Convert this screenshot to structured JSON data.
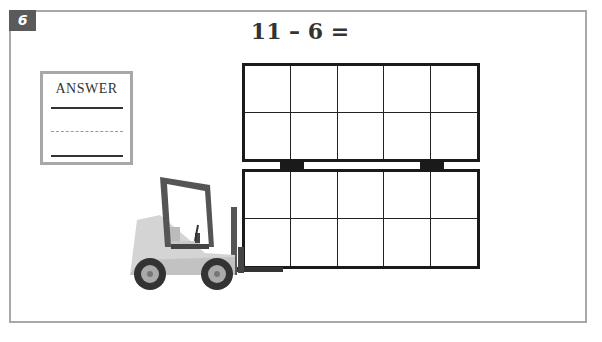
{
  "problem": {
    "number": "6",
    "equation": "11 – 6 =",
    "answer_label": "ANSWER"
  },
  "ten_frames": [
    {
      "id": "top",
      "rows": 2,
      "cols": 5,
      "filled": 0
    },
    {
      "id": "bottom",
      "rows": 2,
      "cols": 5,
      "filled": 0
    }
  ],
  "illustration": {
    "type": "forklift-icon",
    "colors": {
      "body": "#d0d0d0",
      "frame": "#555555",
      "wheel": "#333333",
      "hub": "#aaaaaa"
    }
  }
}
